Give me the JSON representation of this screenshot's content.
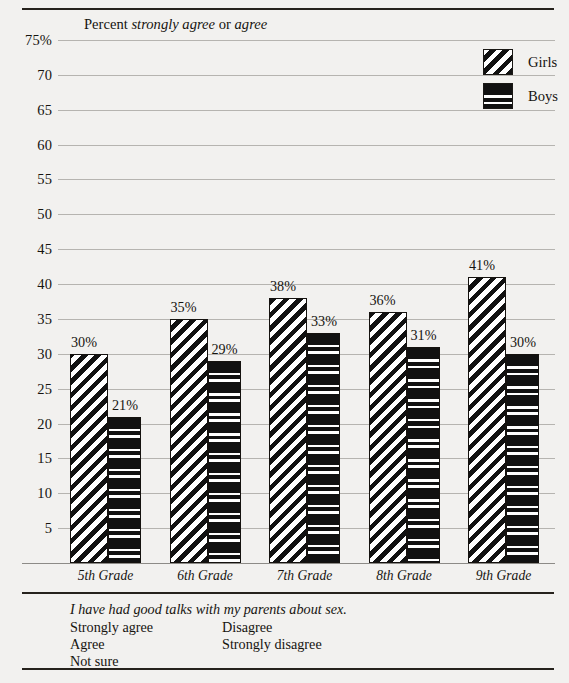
{
  "chart_data": {
    "type": "bar",
    "title": "Percent strongly agree or agree",
    "title_plain": "Percent",
    "title_italic_1": "strongly agree",
    "title_mid": "or",
    "title_italic_2": "agree",
    "xlabel": "",
    "ylabel": "",
    "ylim": [
      0,
      75
    ],
    "grid": true,
    "legend_position": "top-right",
    "categories": [
      "5th Grade",
      "6th Grade",
      "7th Grade",
      "8th Grade",
      "9th Grade"
    ],
    "ytick_labels": [
      "75%",
      "70",
      "65",
      "60",
      "55",
      "50",
      "45",
      "40",
      "35",
      "30",
      "25",
      "20",
      "15",
      "10",
      "5"
    ],
    "ytick_values": [
      75,
      70,
      65,
      60,
      55,
      50,
      45,
      40,
      35,
      30,
      25,
      20,
      15,
      10,
      5
    ],
    "series": [
      {
        "name": "Girls",
        "pattern": "diagonal-stripes",
        "values": [
          30,
          35,
          38,
          36,
          41
        ],
        "value_labels": [
          "30%",
          "35%",
          "38%",
          "36%",
          "41%"
        ]
      },
      {
        "name": "Boys",
        "pattern": "horizontal-bands",
        "values": [
          21,
          29,
          33,
          31,
          30
        ],
        "value_labels": [
          "21%",
          "29%",
          "33%",
          "31%",
          "30%"
        ]
      }
    ]
  },
  "legend": {
    "items": [
      {
        "label": "Girls",
        "pattern": "diagonal-stripes"
      },
      {
        "label": "Boys",
        "pattern": "horizontal-bands"
      }
    ]
  },
  "footer": {
    "question": "I have had good talks with my parents about sex.",
    "options_col1": [
      "Strongly agree",
      "Agree",
      "Not sure"
    ],
    "options_col2": [
      "Disagree",
      "Strongly disagree"
    ]
  },
  "colors": {
    "page_background": "#f2f1ef",
    "ink": "#16140f",
    "rule": "#26221c",
    "gridline": "#b6b4b0",
    "bar_fill": "#111111",
    "bar_background": "#ffffff"
  }
}
